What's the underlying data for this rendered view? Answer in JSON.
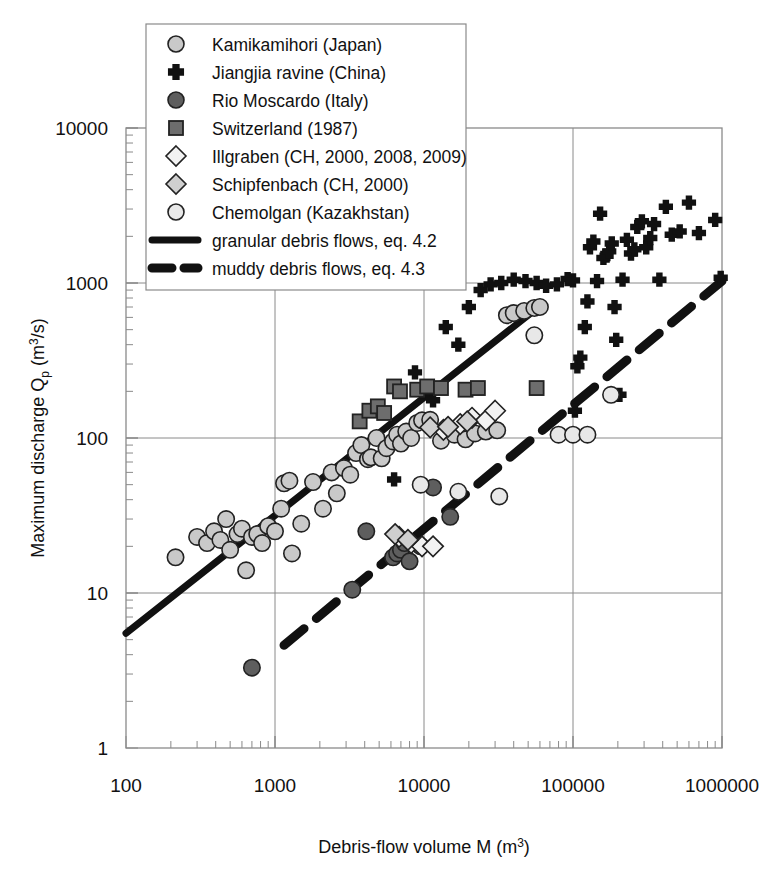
{
  "figure": {
    "title": "",
    "background": "#ffffff",
    "axis_color": "#8a8a8a",
    "marker_outline": "#222222"
  },
  "axes": {
    "x": {
      "label_prefix": "Debris-flow volume M (m",
      "label_sup": "3",
      "label_suffix": ")",
      "scale": "log",
      "min": 100,
      "max": 1000000,
      "ticks": [
        "100",
        "1000",
        "10000",
        "100000",
        "1000000"
      ],
      "tick_values": [
        100,
        1000,
        10000,
        100000,
        1000000
      ]
    },
    "y": {
      "label_prefix": "Maximum discharge Q",
      "label_sub": "p",
      "label_mid": " (m",
      "label_sup": "3",
      "label_suffix": "/s)",
      "scale": "log",
      "min": 1,
      "max": 10000,
      "ticks": [
        "1",
        "10",
        "100",
        "1000",
        "10000"
      ],
      "tick_values": [
        1,
        10,
        100,
        1000,
        10000
      ]
    }
  },
  "legend": {
    "items": [
      {
        "label": "Kamikamihori (Japan)",
        "marker": "circle",
        "fill": "#c9c9c9",
        "key": "kamikamihori"
      },
      {
        "label": "Jiangjia ravine (China)",
        "marker": "plus",
        "fill": "#111111",
        "key": "jiangjia"
      },
      {
        "label": "Rio Moscardo (Italy)",
        "marker": "circle",
        "fill": "#5e5e5e",
        "key": "moscardo"
      },
      {
        "label": "Switzerland (1987)",
        "marker": "square",
        "fill": "#6d6d6d",
        "key": "switzerland"
      },
      {
        "label": "Illgraben (CH, 2000, 2008, 2009)",
        "marker": "diamond",
        "fill": "#f2f2f2",
        "key": "illgraben"
      },
      {
        "label": "Schipfenbach (CH, 2000)",
        "marker": "diamond",
        "fill": "#cfcfcf",
        "key": "schipfenbach"
      },
      {
        "label": "Chemolgan (Kazakhstan)",
        "marker": "circle",
        "fill": "#e8e8e8",
        "key": "chemolgan"
      },
      {
        "label": "granular debris flows, eq. 4.2",
        "marker": "solid-line",
        "fill": "#111111",
        "key": "granular_line"
      },
      {
        "label": "muddy debris flows, eq. 4.3",
        "marker": "dashed-line",
        "fill": "#111111",
        "key": "muddy_line"
      }
    ]
  },
  "chart_data": {
    "type": "scatter",
    "title": "",
    "xlabel": "Debris-flow volume M (m3)",
    "ylabel": "Maximum discharge Qp (m3/s)",
    "xscale": "log",
    "yscale": "log",
    "xlim": [
      100,
      1000000
    ],
    "ylim": [
      1,
      10000
    ],
    "grid": true,
    "legend_position": "top-left",
    "series": [
      {
        "name": "Kamikamihori (Japan)",
        "marker": "circle",
        "fill": "#c9c9c9",
        "points": [
          [
            215,
            17
          ],
          [
            300,
            23
          ],
          [
            350,
            21
          ],
          [
            390,
            25
          ],
          [
            430,
            22
          ],
          [
            470,
            30
          ],
          [
            500,
            19
          ],
          [
            560,
            24
          ],
          [
            600,
            26
          ],
          [
            640,
            14
          ],
          [
            700,
            23
          ],
          [
            760,
            24
          ],
          [
            820,
            21
          ],
          [
            900,
            27
          ],
          [
            1000,
            25
          ],
          [
            1100,
            35
          ],
          [
            1150,
            51
          ],
          [
            1250,
            53
          ],
          [
            1300,
            18
          ],
          [
            1500,
            28
          ],
          [
            1800,
            52
          ],
          [
            2100,
            35
          ],
          [
            2400,
            60
          ],
          [
            2600,
            44
          ],
          [
            2900,
            64
          ],
          [
            3200,
            58
          ],
          [
            3500,
            80
          ],
          [
            3800,
            90
          ],
          [
            4200,
            73
          ],
          [
            4400,
            75
          ],
          [
            4800,
            100
          ],
          [
            5200,
            74
          ],
          [
            5600,
            86
          ],
          [
            6200,
            95
          ],
          [
            6600,
            105
          ],
          [
            7000,
            92
          ],
          [
            7600,
            110
          ],
          [
            8200,
            100
          ],
          [
            9000,
            125
          ],
          [
            9700,
            130
          ],
          [
            11000,
            131
          ],
          [
            13000,
            96
          ],
          [
            16000,
            105
          ],
          [
            19000,
            98
          ],
          [
            22000,
            107
          ],
          [
            26000,
            110
          ],
          [
            31000,
            112
          ],
          [
            36000,
            620
          ],
          [
            40000,
            640
          ],
          [
            47000,
            660
          ],
          [
            55000,
            690
          ],
          [
            60000,
            700
          ]
        ]
      },
      {
        "name": "Jiangjia ravine (China)",
        "marker": "plus",
        "fill": "#111111",
        "points": [
          [
            6300,
            54
          ],
          [
            8700,
            265
          ],
          [
            11500,
            175
          ],
          [
            14000,
            520
          ],
          [
            17000,
            400
          ],
          [
            20000,
            700
          ],
          [
            24000,
            900
          ],
          [
            28000,
            980
          ],
          [
            33000,
            1000
          ],
          [
            40000,
            1050
          ],
          [
            48000,
            1030
          ],
          [
            57000,
            1000
          ],
          [
            66000,
            960
          ],
          [
            78000,
            980
          ],
          [
            92000,
            1060
          ],
          [
            100000,
            1040
          ],
          [
            103000,
            150
          ],
          [
            107000,
            290
          ],
          [
            112000,
            330
          ],
          [
            120000,
            520
          ],
          [
            125000,
            760
          ],
          [
            130000,
            1700
          ],
          [
            137000,
            1850
          ],
          [
            145000,
            1030
          ],
          [
            152000,
            2800
          ],
          [
            160000,
            1450
          ],
          [
            168000,
            1500
          ],
          [
            175000,
            1600
          ],
          [
            182000,
            1800
          ],
          [
            190000,
            700
          ],
          [
            195000,
            430
          ],
          [
            205000,
            190
          ],
          [
            215000,
            1050
          ],
          [
            230000,
            1900
          ],
          [
            245000,
            1550
          ],
          [
            258000,
            1650
          ],
          [
            270000,
            2300
          ],
          [
            290000,
            2500
          ],
          [
            310000,
            1700
          ],
          [
            330000,
            1950
          ],
          [
            350000,
            2400
          ],
          [
            380000,
            1050
          ],
          [
            420000,
            3100
          ],
          [
            460000,
            2050
          ],
          [
            520000,
            2150
          ],
          [
            600000,
            3300
          ],
          [
            700000,
            2100
          ],
          [
            900000,
            2550
          ],
          [
            980000,
            1080
          ]
        ]
      },
      {
        "name": "Rio Moscardo (Italy)",
        "marker": "circle",
        "fill": "#5e5e5e",
        "points": [
          [
            700,
            3.3
          ],
          [
            3300,
            10.5
          ],
          [
            4100,
            25
          ],
          [
            6200,
            17
          ],
          [
            6600,
            18
          ],
          [
            7000,
            19
          ],
          [
            7400,
            21
          ],
          [
            8000,
            16
          ],
          [
            9500,
            20
          ],
          [
            11500,
            48
          ],
          [
            15000,
            31
          ]
        ]
      },
      {
        "name": "Switzerland (1987)",
        "marker": "square",
        "fill": "#6d6d6d",
        "points": [
          [
            3700,
            128
          ],
          [
            4300,
            150
          ],
          [
            4900,
            160
          ],
          [
            5400,
            145
          ],
          [
            6300,
            215
          ],
          [
            6900,
            200
          ],
          [
            9000,
            205
          ],
          [
            10500,
            215
          ],
          [
            13000,
            210
          ],
          [
            19000,
            205
          ],
          [
            23000,
            210
          ],
          [
            57000,
            210
          ]
        ]
      },
      {
        "name": "Illgraben (CH, 2000, 2008, 2009)",
        "marker": "diamond",
        "fill": "#f2f2f2",
        "points": [
          [
            6800,
            23
          ],
          [
            8200,
            21
          ],
          [
            9700,
            20
          ],
          [
            11500,
            20
          ],
          [
            13500,
            113
          ],
          [
            17500,
            123
          ],
          [
            21000,
            135
          ],
          [
            26000,
            130
          ],
          [
            30000,
            150
          ]
        ]
      },
      {
        "name": "Schipfenbach (CH, 2000)",
        "marker": "diamond",
        "fill": "#cfcfcf",
        "points": [
          [
            6400,
            24
          ],
          [
            7800,
            22
          ],
          [
            11000,
            117
          ],
          [
            14500,
            118
          ],
          [
            19500,
            128
          ]
        ]
      },
      {
        "name": "Chemolgan (Kazakhstan)",
        "marker": "circle",
        "fill": "#e8e8e8",
        "points": [
          [
            9500,
            50
          ],
          [
            17000,
            45
          ],
          [
            32000,
            42
          ],
          [
            55000,
            460
          ],
          [
            80000,
            105
          ],
          [
            100000,
            105
          ],
          [
            125000,
            105
          ],
          [
            180000,
            190
          ]
        ]
      }
    ],
    "trend_lines": [
      {
        "name": "granular debris flows, eq. 4.2",
        "style": "solid",
        "color": "#111111",
        "width": 7,
        "x_start": 100,
        "y_start": 5.5,
        "x_end": 62000,
        "y_end": 730
      },
      {
        "name": "muddy debris flows, eq. 4.3",
        "style": "dashed",
        "color": "#111111",
        "width": 9,
        "x_start": 1150,
        "y_start": 4.6,
        "x_end": 1000000,
        "y_end": 1030
      }
    ]
  }
}
